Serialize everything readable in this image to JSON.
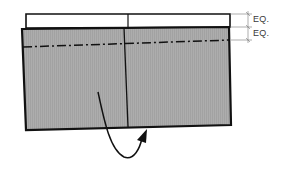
{
  "diagram": {
    "type": "folding-instruction",
    "colors": {
      "panel_fill": "#a9a9a9",
      "outline": "#111111",
      "strip_fill": "#ffffff",
      "dimension_line": "#777777",
      "label_text": "#3a3a3a"
    },
    "labels": {
      "eq_upper": "EQ.",
      "eq_lower": "EQ."
    },
    "elements": {
      "top_strip": "white strip above panel, divided in two halves",
      "panel": "gray shaded rectangular panel",
      "center_line": "vertical crease line at center",
      "fold_line": "dash-dot fold line across panel",
      "dimension": "two equal spacing dimension marks",
      "arrow": "curved arrow indicating fold from left to right under panel"
    }
  }
}
